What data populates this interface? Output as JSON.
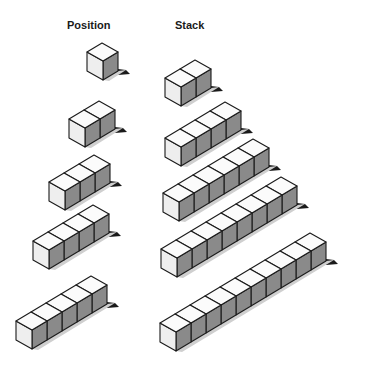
{
  "labels": {
    "position": "Position",
    "stack": "Stack"
  },
  "colors": {
    "top": "#fbfbfb",
    "left": "#eeeeee",
    "right": "#8a8a8a",
    "shadow": "#1a1a1a",
    "stroke": "#1a1a1a"
  },
  "cube": {
    "front_w": 16,
    "depth_dx": 15,
    "depth_dy": 9,
    "height": 19
  },
  "columns": [
    {
      "name": "Position",
      "rows": [
        {
          "count": 1,
          "x": 87,
          "y": 71
        },
        {
          "count": 2,
          "x": 69,
          "y": 138
        },
        {
          "count": 3,
          "x": 49,
          "y": 201
        },
        {
          "count": 4,
          "x": 33,
          "y": 260
        },
        {
          "count": 5,
          "x": 16,
          "y": 340
        }
      ]
    },
    {
      "name": "Stack",
      "rows": [
        {
          "count": 2,
          "x": 165,
          "y": 97
        },
        {
          "count": 4,
          "x": 165,
          "y": 157
        },
        {
          "count": 6,
          "x": 163,
          "y": 212
        },
        {
          "count": 8,
          "x": 161,
          "y": 268
        },
        {
          "count": 10,
          "x": 160,
          "y": 342
        }
      ]
    }
  ]
}
